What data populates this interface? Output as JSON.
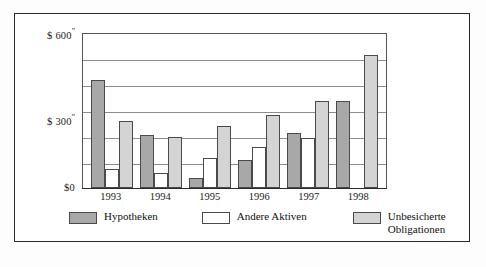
{
  "chart_data": {
    "type": "bar",
    "title": "",
    "xlabel": "",
    "ylabel": "",
    "categories": [
      "1993",
      "1994",
      "1995",
      "1996",
      "1997",
      "1998"
    ],
    "series": [
      {
        "name": "Hypotheken",
        "color": "#a8a8a8",
        "values": [
          420,
          205,
          40,
          110,
          215,
          340
        ]
      },
      {
        "name": "Andere Aktiven",
        "color": "#ffffff",
        "values": [
          75,
          60,
          115,
          160,
          195,
          0
        ]
      },
      {
        "name": "Unbesicherte Obligationen",
        "color": "#d4d4d4",
        "values": [
          260,
          200,
          240,
          285,
          340,
          520
        ]
      }
    ],
    "ylim": [
      0,
      600
    ],
    "ytick_values": [
      0,
      300,
      600
    ],
    "ytick_labels": [
      "$0",
      "$ 300\"",
      "$ 600 \""
    ],
    "gridlines": [
      100,
      200,
      300,
      400,
      500,
      600
    ],
    "grid": true,
    "legend_position": "bottom"
  },
  "axis": {
    "y_ticks": [
      {
        "label_prefix": "$ 600",
        "sup": "\"",
        "value": 600
      },
      {
        "label_prefix": "$ 300",
        "sup": "\"",
        "value": 300
      },
      {
        "label_prefix": "$0",
        "sup": "",
        "value": 0
      }
    ]
  },
  "legend": {
    "items": [
      {
        "label": "Hypotheken",
        "swatch": "s0"
      },
      {
        "label": "Andere Aktiven",
        "swatch": "s1"
      },
      {
        "label": "Unbesicherte\nObligationen",
        "swatch": "s2"
      }
    ]
  }
}
